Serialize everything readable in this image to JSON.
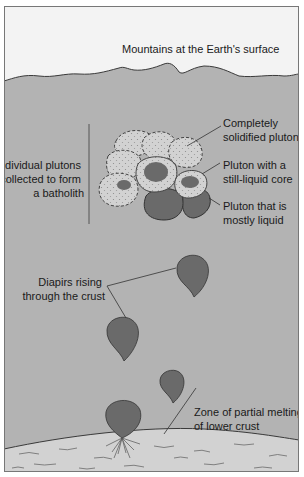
{
  "labels": {
    "surface": "Mountains at the Earth's surface",
    "batholith": [
      "Individual plutons",
      "collected to form",
      "a batholith"
    ],
    "solidified": [
      "Completely",
      "solidified pluton"
    ],
    "liquid_core": [
      "Pluton with a",
      "still-liquid core"
    ],
    "mostly_liquid": [
      "Pluton that is",
      "mostly liquid"
    ],
    "diapirs": [
      "Diapirs rising",
      "through the crust"
    ],
    "melting_zone": [
      "Zone of partial melting",
      "of lower crust"
    ]
  },
  "colors": {
    "sky": "#f3f3f3",
    "crust": "#b3b3b3",
    "lower_crust": "#d2d2d2",
    "pluton_solid": "#d0d0d0",
    "pluton_liquid": "#6a6a6a",
    "outline": "#3a3a3a"
  }
}
